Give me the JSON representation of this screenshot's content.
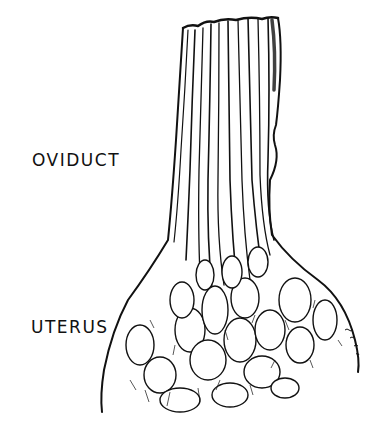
{
  "figure": {
    "type": "anatomical pen-and-ink illustration",
    "labels": {
      "upper": "OVIDUCT",
      "lower": "UTERUS"
    },
    "colors": {
      "background": "#ffffff",
      "ink": "#111111"
    }
  }
}
